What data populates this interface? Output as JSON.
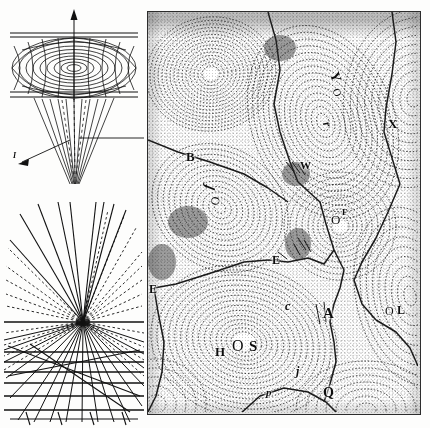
{
  "figure": {
    "domain_note": "scanned plate of three scientific line-engravings",
    "background_color": "#fdfdfc",
    "ink_color": "#111111",
    "panels": [
      {
        "id": "funnel-panel",
        "name": "vortex-funnel-diagram"
      },
      {
        "id": "perspective-panel",
        "name": "perspective-vanishing-point-diagram"
      },
      {
        "id": "cell-panel",
        "name": "cellular-vortex-field-engraving"
      }
    ]
  },
  "funnel_diagram": {
    "title": "",
    "labels": [
      {
        "text": "I",
        "x": 17,
        "y": 152,
        "size": 8,
        "italic": true,
        "rotate": 0
      }
    ],
    "axis_arrow": {
      "from_y": 96,
      "to_y": 8,
      "x": 79
    },
    "grid": {
      "meridians": 16,
      "parallels": 9
    }
  },
  "perspective_diagram": {
    "labels": [],
    "vanishing_point": {
      "x": 79,
      "y": 122
    },
    "ray_count": 33,
    "horizon_y": 122,
    "ground_lines": 8
  },
  "cell_panel": {
    "frame_color": "#2c2c2c",
    "labels": [
      {
        "text": "B",
        "x": 38,
        "y": 144,
        "size": 13,
        "rotate": 0,
        "weight": 700
      },
      {
        "text": "f",
        "x": 58,
        "y": 176,
        "size": 14,
        "rotate": -78,
        "weight": 700,
        "italic": true
      },
      {
        "text": "O",
        "x": 63,
        "y": 190,
        "size": 12,
        "rotate": -78,
        "weight": 400
      },
      {
        "text": "Y",
        "x": 182,
        "y": 66,
        "size": 14,
        "rotate": 72,
        "weight": 700
      },
      {
        "text": "O",
        "x": 185,
        "y": 82,
        "size": 11,
        "rotate": 72,
        "weight": 400
      },
      {
        "text": "r",
        "x": 177,
        "y": 113,
        "size": 12,
        "rotate": 70,
        "weight": 700,
        "italic": true
      },
      {
        "text": "X",
        "x": 240,
        "y": 112,
        "size": 13,
        "rotate": 0,
        "weight": 700
      },
      {
        "text": "W",
        "x": 152,
        "y": 154,
        "size": 11,
        "rotate": 0,
        "weight": 700
      },
      {
        "text": "O",
        "x": 183,
        "y": 208,
        "size": 13,
        "rotate": 0,
        "weight": 400
      },
      {
        "text": "F",
        "x": 194,
        "y": 202,
        "size": 9,
        "rotate": 0,
        "weight": 700
      },
      {
        "text": "E",
        "x": 124,
        "y": 249,
        "size": 12,
        "rotate": 0,
        "weight": 700
      },
      {
        "text": "E",
        "x": 1,
        "y": 278,
        "size": 12,
        "rotate": 0,
        "weight": 700
      },
      {
        "text": "c",
        "x": 137,
        "y": 295,
        "size": 12,
        "rotate": 0,
        "weight": 700,
        "italic": true
      },
      {
        "text": "A",
        "x": 175,
        "y": 302,
        "size": 15,
        "rotate": 0,
        "weight": 700
      },
      {
        "text": "O",
        "x": 237,
        "y": 300,
        "size": 12,
        "rotate": 0,
        "weight": 400
      },
      {
        "text": "L",
        "x": 248,
        "y": 299,
        "size": 12,
        "rotate": 0,
        "weight": 700
      },
      {
        "text": "H",
        "x": 67,
        "y": 340,
        "size": 13,
        "rotate": 0,
        "weight": 700
      },
      {
        "text": "O",
        "x": 85,
        "y": 334,
        "size": 16,
        "rotate": 0,
        "weight": 400
      },
      {
        "text": "S",
        "x": 101,
        "y": 334,
        "size": 15,
        "rotate": 0,
        "weight": 700
      },
      {
        "text": "j",
        "x": 148,
        "y": 360,
        "size": 12,
        "rotate": 0,
        "weight": 700,
        "italic": true
      },
      {
        "text": "p",
        "x": 118,
        "y": 382,
        "size": 11,
        "rotate": 0,
        "weight": 700,
        "italic": true
      },
      {
        "text": "Q",
        "x": 175,
        "y": 382,
        "size": 14,
        "rotate": 0,
        "weight": 700
      }
    ],
    "cells": [
      {
        "name": "cell-top-left-concentric",
        "cx": 63,
        "cy": 62,
        "rx": 56,
        "ry": 50,
        "rings": 17,
        "rot": -8,
        "tone": "light"
      },
      {
        "name": "cell-upper-mid-oval",
        "cx": 175,
        "cy": 110,
        "rx": 62,
        "ry": 86,
        "rings": 20,
        "rot": -22,
        "tone": "mid"
      },
      {
        "name": "cell-left-mid-oval",
        "cx": 72,
        "cy": 196,
        "rx": 62,
        "ry": 55,
        "rings": 16,
        "rot": 36,
        "tone": "mid"
      },
      {
        "name": "cell-right-upper",
        "cx": 266,
        "cy": 86,
        "rx": 54,
        "ry": 70,
        "rings": 14,
        "rot": 10,
        "tone": "light"
      },
      {
        "name": "cell-right-F",
        "cx": 192,
        "cy": 214,
        "rx": 50,
        "ry": 48,
        "rings": 14,
        "rot": 0,
        "tone": "light"
      },
      {
        "name": "cell-right-L",
        "cx": 262,
        "cy": 284,
        "rx": 48,
        "ry": 76,
        "rings": 13,
        "rot": -12,
        "tone": "light"
      },
      {
        "name": "cell-bottom-HOS",
        "cx": 96,
        "cy": 330,
        "rx": 82,
        "ry": 70,
        "rings": 22,
        "rot": 14,
        "tone": "mid"
      },
      {
        "name": "cell-bottom-right",
        "cx": 218,
        "cy": 398,
        "rx": 60,
        "ry": 44,
        "rings": 11,
        "rot": 0,
        "tone": "light"
      },
      {
        "name": "cell-bottom-left-corner",
        "cx": 8,
        "cy": 392,
        "rx": 40,
        "ry": 38,
        "rings": 9,
        "rot": 0,
        "tone": "light"
      }
    ],
    "boundaries": [
      "M0,128 L30,140 L62,150 L96,162 L120,176 L140,190",
      "M120,0 L128,28 L132,58 L126,92 L132,120 L142,150 L150,170",
      "M150,170 L172,190 L178,212 L186,238 L176,252 L160,246 L140,250 L120,248",
      "M120,248 L96,250 L60,262 L28,272 L6,276",
      "M244,0 L248,30 L244,62 L238,96 L236,120 L244,146 L252,172",
      "M252,172 L240,200 L228,226 L214,250 L206,268 L214,292 L228,308",
      "M186,238 L196,258 L192,276 L186,292 L182,310 L186,330 L188,350 L182,372 L176,390",
      "M228,308 L248,320 L262,336 L270,354",
      "M6,276 L10,300 L16,330 L14,360 L8,384 L0,400",
      "M92,402 L112,384 L136,376 L160,380 L178,390 L190,402"
    ]
  }
}
